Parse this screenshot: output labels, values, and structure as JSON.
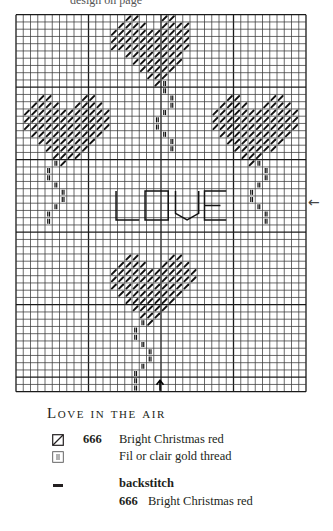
{
  "page": {
    "top_caption": "design on page",
    "side_arrow": "←",
    "bottom_arrow": "↑"
  },
  "chart_data": {
    "type": "cross-stitch-chart",
    "title": "Love in the air",
    "grid": {
      "cols": 40,
      "rows": 52,
      "left": 16,
      "top": 14.7,
      "cell": 7.25,
      "major_every": 10,
      "line_color": "#3a3a3a",
      "major_color": "#1a1a1a"
    },
    "cross_stitch_rows": [
      {
        "row": 0,
        "cols": [
          15,
          16,
          20,
          21
        ]
      },
      {
        "row": 1,
        "cols": [
          14,
          15,
          16,
          17,
          20,
          21,
          22,
          23
        ]
      },
      {
        "row": 2,
        "range": [
          13,
          23
        ]
      },
      {
        "row": 3,
        "range": [
          13,
          23
        ]
      },
      {
        "row": 4,
        "range": [
          13,
          23
        ]
      },
      {
        "row": 5,
        "range": [
          15,
          22
        ]
      },
      {
        "row": 6,
        "range": [
          16,
          22
        ]
      },
      {
        "row": 7,
        "range": [
          17,
          21
        ]
      },
      {
        "row": 8,
        "range": [
          18,
          20
        ]
      },
      {
        "row": 9,
        "cols": [
          19
        ]
      },
      {
        "row": 11,
        "cols": [
          3,
          4,
          9,
          10,
          29,
          30,
          35,
          36
        ]
      },
      {
        "row": 12,
        "cols": [
          2,
          3,
          4,
          5,
          8,
          9,
          10,
          11,
          28,
          29,
          30,
          31,
          34,
          35,
          36,
          37
        ]
      },
      {
        "row": 13,
        "ranges": [
          [
            1,
            12
          ],
          [
            27,
            38
          ]
        ]
      },
      {
        "row": 14,
        "ranges": [
          [
            1,
            12
          ],
          [
            27,
            38
          ]
        ]
      },
      {
        "row": 15,
        "ranges": [
          [
            1,
            12
          ],
          [
            27,
            38
          ]
        ]
      },
      {
        "row": 16,
        "ranges": [
          [
            2,
            11
          ],
          [
            28,
            37
          ]
        ]
      },
      {
        "row": 17,
        "ranges": [
          [
            3,
            10
          ],
          [
            29,
            36
          ]
        ]
      },
      {
        "row": 18,
        "ranges": [
          [
            4,
            9
          ],
          [
            30,
            35
          ]
        ]
      },
      {
        "row": 19,
        "ranges": [
          [
            5,
            8
          ],
          [
            31,
            33
          ]
        ]
      },
      {
        "row": 20,
        "cols": [
          6,
          32
        ]
      },
      {
        "row": 33,
        "cols": [
          15,
          16,
          21,
          22
        ]
      },
      {
        "row": 34,
        "cols": [
          14,
          15,
          16,
          17,
          20,
          21,
          22,
          23
        ]
      },
      {
        "row": 35,
        "range": [
          13,
          24
        ]
      },
      {
        "row": 36,
        "range": [
          13,
          24
        ]
      },
      {
        "row": 37,
        "range": [
          13,
          23
        ]
      },
      {
        "row": 38,
        "range": [
          14,
          22
        ]
      },
      {
        "row": 39,
        "range": [
          15,
          21
        ]
      },
      {
        "row": 40,
        "range": [
          16,
          20
        ]
      },
      {
        "row": 41,
        "range": [
          17,
          19
        ]
      },
      {
        "row": 42,
        "cols": [
          18
        ]
      }
    ],
    "gold_stitches": [
      [
        9,
        20
      ],
      [
        10,
        20
      ],
      [
        11,
        21
      ],
      [
        12,
        21
      ],
      [
        13,
        20
      ],
      [
        14,
        19
      ],
      [
        15,
        19
      ],
      [
        16,
        20
      ],
      [
        17,
        21
      ],
      [
        18,
        21
      ],
      [
        20,
        5
      ],
      [
        21,
        4
      ],
      [
        22,
        4
      ],
      [
        23,
        5
      ],
      [
        24,
        6
      ],
      [
        25,
        6
      ],
      [
        26,
        5
      ],
      [
        27,
        4
      ],
      [
        28,
        4
      ],
      [
        20,
        33
      ],
      [
        21,
        34
      ],
      [
        22,
        34
      ],
      [
        23,
        33
      ],
      [
        24,
        32
      ],
      [
        25,
        32
      ],
      [
        26,
        33
      ],
      [
        27,
        34
      ],
      [
        28,
        34
      ],
      [
        42,
        17
      ],
      [
        43,
        16
      ],
      [
        44,
        16
      ],
      [
        45,
        17
      ],
      [
        46,
        18
      ],
      [
        47,
        18
      ],
      [
        48,
        17
      ],
      [
        49,
        16
      ],
      [
        50,
        16
      ],
      [
        51,
        16
      ]
    ],
    "backstitch_text": {
      "text": "LOVE",
      "top_row": 24.3,
      "bottom_row": 28.3,
      "letters": [
        {
          "char": "L",
          "x0": 13.8,
          "x1": 17.0
        },
        {
          "char": "O",
          "x0": 17.8,
          "x1": 21.0
        },
        {
          "char": "V",
          "x0": 22.0,
          "x1": 25.2
        },
        {
          "char": "E",
          "x0": 26.0,
          "x1": 29.0
        }
      ]
    },
    "center_markers": {
      "side_arrow_row": 26,
      "bottom_arrow_col": 20
    }
  },
  "title": "Love in the air",
  "legend": {
    "items": [
      {
        "symbol": "diagonal-box",
        "code": "666",
        "name": "Bright Christmas red"
      },
      {
        "symbol": "double-bar-box",
        "code": "",
        "name": "Fil or clair gold thread"
      }
    ],
    "backstitch": {
      "symbol": "dash",
      "label": "backstitch",
      "code": "666",
      "name": "Bright Christmas red"
    }
  }
}
